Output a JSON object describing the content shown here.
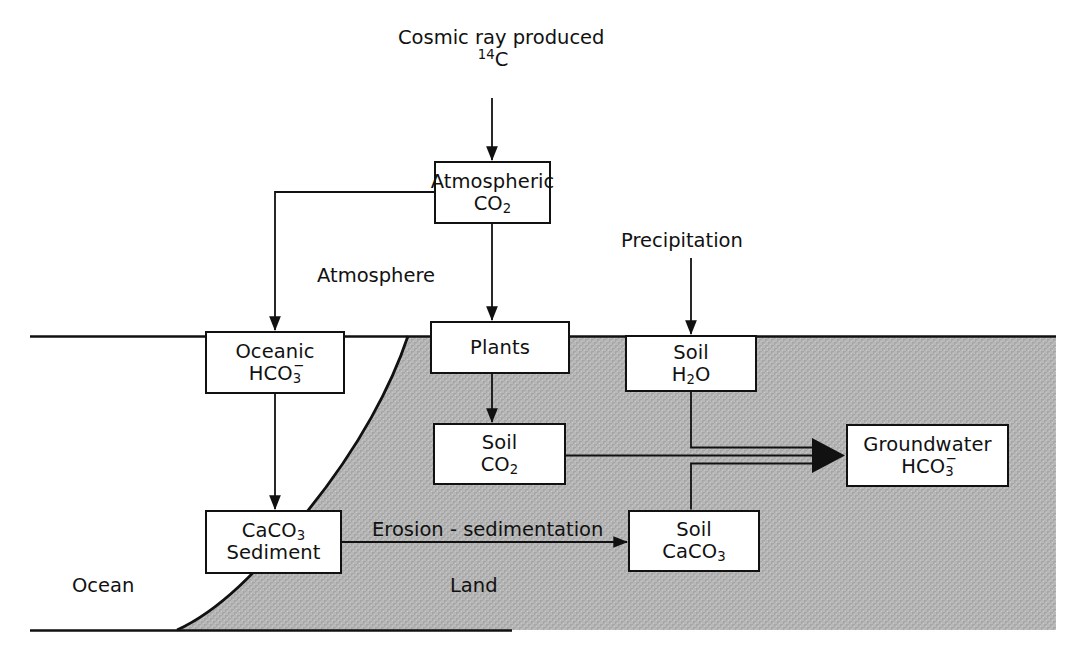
{
  "figure": {
    "background_color": "#ffffff",
    "line_color": "#111111",
    "land_fill_color": "#b4b4b4"
  },
  "source_label": {
    "line1": "Cosmic ray produced",
    "isotope_mass": "14",
    "isotope_symbol": "C"
  },
  "nodes": [
    {
      "id": "atmospheric-co2",
      "line1": "Atmospheric",
      "line2_formula": "CO",
      "line2_sub": "2"
    },
    {
      "id": "oceanic-hco3",
      "line1": "Oceanic",
      "line2_formula": "HCO",
      "line2_sub": "3",
      "line2_charge": "−"
    },
    {
      "id": "plants",
      "line1": "Plants"
    },
    {
      "id": "soil-h2o",
      "line1": "Soil",
      "line2_formula_a": "H",
      "line2_sub_a": "2",
      "line2_formula_b": "O"
    },
    {
      "id": "soil-co2",
      "line1": "Soil",
      "line2_formula": "CO",
      "line2_sub": "2"
    },
    {
      "id": "groundwater-hco3",
      "line1": "Groundwater",
      "line2_formula": "HCO",
      "line2_sub": "3",
      "line2_charge": "−"
    },
    {
      "id": "caco3-sediment",
      "line1_formula": "CaCO",
      "line1_sub": "3",
      "line2": "Sediment"
    },
    {
      "id": "soil-caco3",
      "line1": "Soil",
      "line2_formula": "CaCO",
      "line2_sub": "3"
    }
  ],
  "labels": {
    "atmosphere": "Atmosphere",
    "precipitation": "Precipitation",
    "erosion_sedimentation": "Erosion - sedimentation",
    "ocean": "Ocean",
    "land": "Land"
  },
  "arrows": [
    {
      "id": "cosmic-to-atmospheric",
      "from": "cosmic-ray-source",
      "to": "atmospheric-co2",
      "arrowhead": true
    },
    {
      "id": "atmospheric-to-oceanic",
      "from": "atmospheric-co2",
      "to": "oceanic-hco3",
      "arrowhead": true
    },
    {
      "id": "atmospheric-to-plants",
      "from": "atmospheric-co2",
      "to": "plants",
      "arrowhead": true
    },
    {
      "id": "precipitation-to-soil-h2o",
      "from": "precipitation",
      "to": "soil-h2o",
      "arrowhead": true
    },
    {
      "id": "plants-to-soil-co2",
      "from": "plants",
      "to": "soil-co2",
      "arrowhead": true
    },
    {
      "id": "oceanic-to-caco3-sediment",
      "from": "oceanic-hco3",
      "to": "caco3-sediment",
      "arrowhead": true
    },
    {
      "id": "caco3-sediment-to-soil-caco3",
      "from": "caco3-sediment",
      "to": "soil-caco3",
      "arrowhead": true,
      "label": "Erosion - sedimentation"
    },
    {
      "id": "soil-h2o-to-groundwater",
      "from": "soil-h2o",
      "to": "groundwater-hco3",
      "arrowhead": true
    },
    {
      "id": "soil-co2-to-groundwater",
      "from": "soil-co2",
      "to": "groundwater-hco3",
      "arrowhead": true
    },
    {
      "id": "soil-caco3-to-groundwater",
      "from": "soil-caco3",
      "to": "groundwater-hco3",
      "arrowhead": true
    }
  ]
}
